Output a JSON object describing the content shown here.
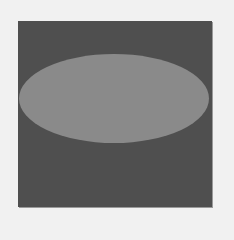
{
  "figure": {
    "background_color": "#f1f1f1",
    "square": {
      "color": "#4f4f4f",
      "x": 18,
      "y": 21,
      "width": 194,
      "height": 186
    },
    "ellipse": {
      "color": "#8a8a8a",
      "center_x": 114,
      "center_y": 98,
      "width": 190,
      "height": 89
    }
  }
}
